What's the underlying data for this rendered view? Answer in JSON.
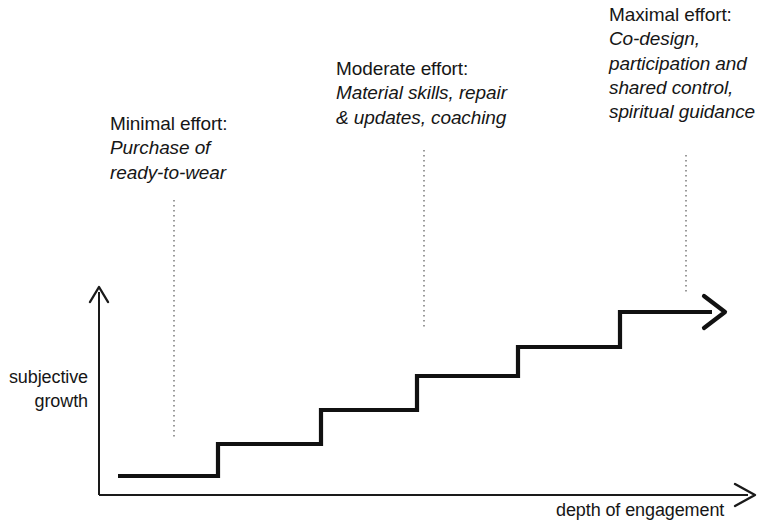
{
  "figure": {
    "type": "diagram",
    "subtype": "step-chart",
    "background_color": "#ffffff",
    "ink_color": "#111111",
    "leader_color": "#9a9a9a"
  },
  "axes": {
    "y_label_lines": [
      "subjective",
      "growth"
    ],
    "x_label": "depth of engagement",
    "y_axis": {
      "x": 99,
      "y_top": 287,
      "y_bottom": 495,
      "arrow": "up"
    },
    "x_axis": {
      "y": 495,
      "x_left": 99,
      "x_right": 755,
      "arrow": "right"
    }
  },
  "annotations": [
    {
      "id": "minimal",
      "title": "Minimal effort:",
      "body_lines": [
        "Purchase of",
        "ready-to-wear"
      ],
      "leader_x": 174,
      "leader_y_top": 200,
      "leader_y_bottom": 440
    },
    {
      "id": "moderate",
      "title": "Moderate effort:",
      "body_lines": [
        "Material skills, repair",
        "& updates, coaching"
      ],
      "leader_x": 424,
      "leader_y_top": 150,
      "leader_y_bottom": 328
    },
    {
      "id": "maximal",
      "title": "Maximal effort:",
      "body_lines": [
        "Co-design,",
        "participation and",
        "shared control,",
        "spiritual guidance"
      ],
      "leader_x": 686,
      "leader_y_top": 155,
      "leader_y_bottom": 295
    }
  ],
  "chart_data": {
    "type": "line",
    "title": "",
    "xlabel": "depth of engagement",
    "ylabel": "subjective growth",
    "grid": false,
    "legend": "none",
    "steps": [
      {
        "index": 1,
        "x_start": 118,
        "x_end": 218,
        "y": 476,
        "level": 1
      },
      {
        "index": 2,
        "x_start": 218,
        "x_end": 321,
        "y": 444,
        "level": 2
      },
      {
        "index": 3,
        "x_start": 321,
        "x_end": 417,
        "y": 410,
        "level": 3
      },
      {
        "index": 4,
        "x_start": 417,
        "x_end": 518,
        "y": 376,
        "level": 4
      },
      {
        "index": 5,
        "x_start": 518,
        "x_end": 620,
        "y": 347,
        "level": 5
      },
      {
        "index": 6,
        "x_start": 620,
        "x_end": 712,
        "y": 312,
        "level": 6
      }
    ],
    "step_path": "M118,476 L218,476 L218,444 L321,444 L321,410 L417,410 L417,376 L518,376 L518,347 L620,347 L620,312 L712,312",
    "arrow_tip_x": 725,
    "arrow_tip_y": 312
  }
}
